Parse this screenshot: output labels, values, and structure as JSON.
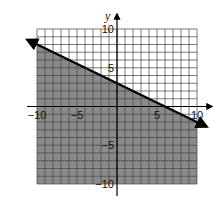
{
  "chart_data": {
    "type": "inequality_graph",
    "title": "",
    "xlabel": "",
    "ylabel": "y",
    "xlim": [
      -10,
      10
    ],
    "ylim": [
      -10,
      10
    ],
    "grid": true,
    "grid_step": 1,
    "x_tick_labels": [
      "-10",
      "-5",
      "5",
      "10"
    ],
    "y_tick_labels": [
      "10",
      "5",
      "-5",
      "-10"
    ],
    "boundary_line": {
      "equation": "y = -1/2 x + 3",
      "slope": -0.5,
      "y_intercept": 3,
      "x_intercept": 6,
      "style": "solid",
      "arrows": "both"
    },
    "shaded_region": "below",
    "inequality": "y <= -1/2 x + 3"
  },
  "colors": {
    "shade": "#8a8a8a",
    "grid_unshaded": "#555555",
    "line": "#000000",
    "background": "#ffffff"
  },
  "labels": {
    "y_axis": "y",
    "x_ticks": [
      {
        "value": -10,
        "text": "−10"
      },
      {
        "value": -5,
        "text": "−5"
      },
      {
        "value": 5,
        "text": "5"
      },
      {
        "value": 10,
        "text": "10"
      }
    ],
    "y_ticks": [
      {
        "value": 10,
        "text": "10"
      },
      {
        "value": 5,
        "text": "5"
      },
      {
        "value": -5,
        "text": "−5"
      },
      {
        "value": -10,
        "text": "−10"
      }
    ]
  }
}
